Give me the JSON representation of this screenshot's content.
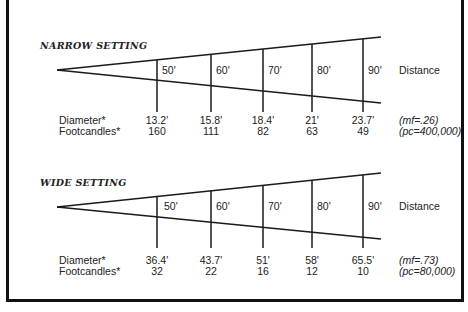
{
  "diagrams": [
    {
      "title": "NARROW SETTING",
      "distances": [
        "50'",
        "60'",
        "70'",
        "80'",
        "90'"
      ],
      "distance_label": "Distance",
      "diameter_label": "Diameter*",
      "footcandles_label": "Footcandles*",
      "diameters": [
        "13.2'",
        "15.8'",
        "18.4'",
        "21'",
        "23.7'"
      ],
      "footcandles": [
        "160",
        "111",
        "82",
        "63",
        "49"
      ],
      "mf_note": "(mf=.26)",
      "pc_note": "(pc=400,000)"
    },
    {
      "title": "WIDE SETTING",
      "distances": [
        "50'",
        "60'",
        "70'",
        "80'",
        "90'"
      ],
      "distance_label": "Distance",
      "diameter_label": "Diameter*",
      "footcandles_label": "Footcandles*",
      "diameters": [
        "36.4'",
        "43.7'",
        "51'",
        "58'",
        "65.5'"
      ],
      "footcandles": [
        "32",
        "22",
        "16",
        "12",
        "10"
      ],
      "mf_note": "(mf=.73)",
      "pc_note": "(pc=80,000)"
    }
  ]
}
